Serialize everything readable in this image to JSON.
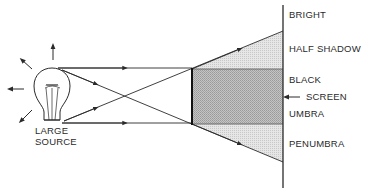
{
  "diagram": {
    "source_label_line1": "LARGE",
    "source_label_line2": "SOURCE",
    "screen_labels": {
      "bright": "BRIGHT",
      "half_shadow": "HALF SHADOW",
      "black": "BLACK",
      "screen": "SCREEN",
      "umbra": "UMBRA",
      "penumbra": "PENUMBRA"
    },
    "colors": {
      "line": "#2a2a2a",
      "umbra_fill": "#b8b8b8",
      "penumbra_fill": "#dcdcdc"
    }
  }
}
